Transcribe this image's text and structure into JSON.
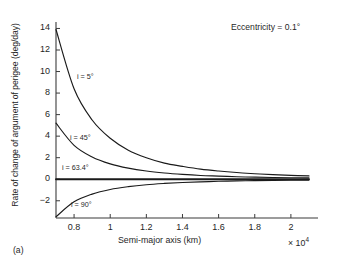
{
  "panel_label": "(a)",
  "annotation": "Eccentricity = 0.1°",
  "axes": {
    "ylabel": "Rate of change of argument of perigee (deg/day)",
    "xlabel": "Semi-major axis (km)",
    "x_multiplier_prefix": "× 10",
    "x_multiplier_exp": "4",
    "yticks": [
      "14",
      "12",
      "10",
      "8",
      "6",
      "4",
      "2",
      "0",
      "−2"
    ],
    "xticks": [
      "0.8",
      "1",
      "1.2",
      "1.4",
      "1.6",
      "1.8",
      "2"
    ]
  },
  "curve_labels": {
    "i5": "i = 5°",
    "i45": "i = 45°",
    "i634": "i = 63.4°",
    "i90": "i = 90°"
  },
  "colors": {
    "axis": "#3b3b3b",
    "curve": "#1a1a1a",
    "background": "#ffffff"
  },
  "chart_data": {
    "type": "line",
    "title": "",
    "xlabel": "Semi-major axis (km)",
    "ylabel": "Rate of change of argument of perigee (deg/day)",
    "x_multiplier": 10000,
    "xlim": [
      0.7,
      2.15
    ],
    "ylim": [
      -3.6,
      14.6
    ],
    "grid": false,
    "legend": "inline-curve-labels",
    "annotations": [
      "Eccentricity = 0.1°",
      "(a)"
    ],
    "x": [
      0.7,
      0.8,
      0.9,
      1.0,
      1.1,
      1.2,
      1.3,
      1.4,
      1.5,
      1.6,
      1.7,
      1.8,
      1.9,
      2.0,
      2.1
    ],
    "series": [
      {
        "name": "i = 5°",
        "values": [
          13.9,
          8.4,
          5.5,
          3.8,
          2.7,
          2.0,
          1.5,
          1.2,
          0.94,
          0.76,
          0.62,
          0.51,
          0.43,
          0.36,
          0.31
        ]
      },
      {
        "name": "i = 45°",
        "values": [
          5.2,
          3.15,
          2.07,
          1.43,
          1.03,
          0.76,
          0.58,
          0.45,
          0.35,
          0.29,
          0.23,
          0.19,
          0.16,
          0.14,
          0.12
        ]
      },
      {
        "name": "i = 63.4°",
        "values": [
          0,
          0,
          0,
          0,
          0,
          0,
          0,
          0,
          0,
          0,
          0,
          0,
          0,
          0,
          0
        ]
      },
      {
        "name": "i = 90°",
        "values": [
          -3.48,
          -2.1,
          -1.38,
          -0.95,
          -0.69,
          -0.51,
          -0.39,
          -0.3,
          -0.24,
          -0.19,
          -0.155,
          -0.128,
          -0.107,
          -0.09,
          -0.077
        ]
      }
    ]
  }
}
